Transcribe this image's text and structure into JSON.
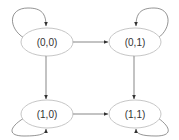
{
  "diagram": {
    "type": "state-transition-graph",
    "colors": {
      "background": "#ffffff",
      "node_stroke": "#b8b8b8",
      "edge_stroke": "#555555",
      "label": "#333333"
    },
    "nodes": [
      {
        "id": "s00",
        "label": "(0,0)"
      },
      {
        "id": "s01",
        "label": "(0,1)"
      },
      {
        "id": "s10",
        "label": "(1,0)"
      },
      {
        "id": "s11",
        "label": "(1,1)"
      }
    ],
    "edges": [
      {
        "from": "(0,0)",
        "to": "(0,1)",
        "direction": "bidirectional"
      },
      {
        "from": "(1,0)",
        "to": "(1,1)",
        "direction": "bidirectional"
      },
      {
        "from": "(0,0)",
        "to": "(1,0)",
        "direction": "bidirectional"
      },
      {
        "from": "(0,1)",
        "to": "(1,1)",
        "direction": "bidirectional"
      },
      {
        "from": "(0,0)",
        "to": "(0,0)",
        "direction": "self-loop"
      },
      {
        "from": "(0,1)",
        "to": "(0,1)",
        "direction": "self-loop"
      },
      {
        "from": "(1,0)",
        "to": "(1,0)",
        "direction": "self-loop"
      },
      {
        "from": "(1,1)",
        "to": "(1,1)",
        "direction": "self-loop"
      }
    ]
  }
}
